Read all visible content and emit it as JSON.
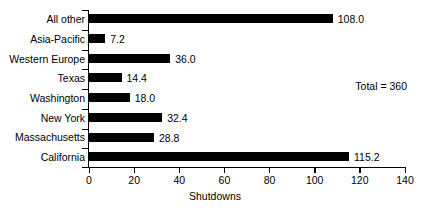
{
  "chart_data": {
    "type": "bar",
    "orientation": "horizontal",
    "title": "",
    "xlabel": "Shutdowns",
    "ylabel": "",
    "xlim": [
      0,
      140
    ],
    "xticks": [
      0,
      20,
      40,
      60,
      80,
      100,
      120,
      140
    ],
    "grid": false,
    "legend": null,
    "bar_color": "#000000",
    "categories": [
      "All other",
      "Asia-Pacific",
      "Western Europe",
      "Texas",
      "Washington",
      "New York",
      "Massachusetts",
      "California"
    ],
    "values": [
      108.0,
      7.2,
      36.0,
      14.4,
      18.0,
      32.4,
      28.8,
      115.2
    ],
    "value_labels": [
      "108.0",
      "7.2",
      "36.0",
      "14.4",
      "18.0",
      "32.4",
      "28.8",
      "115.2"
    ],
    "annotations": [
      {
        "text": "Total = 360",
        "x": 118,
        "y_category": "Washington"
      }
    ]
  },
  "axis": {
    "x_title": "Shutdowns",
    "tick_labels": [
      "0",
      "20",
      "40",
      "60",
      "80",
      "100",
      "120",
      "140"
    ]
  },
  "annotation": {
    "total_text": "Total = 360"
  }
}
